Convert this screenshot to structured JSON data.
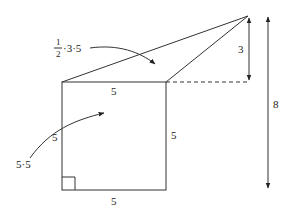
{
  "diagram": {
    "type": "geometry-area-decomposition",
    "colors": {
      "stroke": "#333333",
      "text": "#222222",
      "background": "#ffffff"
    },
    "shapes": {
      "square": {
        "label": "square",
        "side": 5
      },
      "triangle": {
        "label": "triangle",
        "base": 5,
        "height": 3
      }
    },
    "labels": {
      "triangle_area": {
        "frac_num": "1",
        "frac_den": "2",
        "rest": "·3·5"
      },
      "square_area": "5·5",
      "top_side": "5",
      "left_side": "5",
      "right_side": "5",
      "bottom_side": "5",
      "height_small": "3",
      "height_total": "8"
    }
  }
}
